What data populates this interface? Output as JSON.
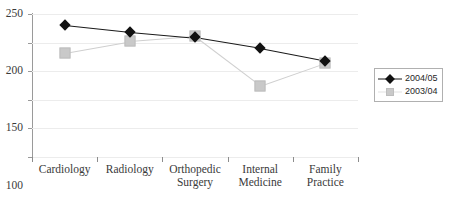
{
  "chart_data": {
    "type": "line",
    "title": "",
    "xlabel": "",
    "ylabel": "",
    "ylim": [
      0,
      250
    ],
    "yticks": [
      0,
      50,
      100,
      150,
      200,
      250
    ],
    "grid": true,
    "legend_position": "right",
    "categories": [
      "Cardiology",
      "Radiology",
      "Orthopedic Surgery",
      "Internal Medicine",
      "Family Practice"
    ],
    "category_lines": [
      [
        "Cardiology"
      ],
      [
        "Radiology"
      ],
      [
        "Orthopedic",
        "Surgery"
      ],
      [
        "Internal",
        "Medicine"
      ],
      [
        "Family",
        "Practice"
      ]
    ],
    "series": [
      {
        "name": "2004/05",
        "marker": "diamond",
        "color": "#111111",
        "values": [
          231,
          219,
          209,
          190,
          168
        ]
      },
      {
        "name": "2003/04",
        "marker": "square",
        "color": "#c9c9c9",
        "values": [
          182,
          202,
          211,
          125,
          165
        ]
      }
    ]
  },
  "legend": {
    "items": [
      {
        "label": "2004/05"
      },
      {
        "label": "2003/04"
      }
    ]
  },
  "axis": {
    "y_tick_labels": [
      "250",
      "200",
      "150",
      "100",
      "50",
      "0"
    ]
  }
}
